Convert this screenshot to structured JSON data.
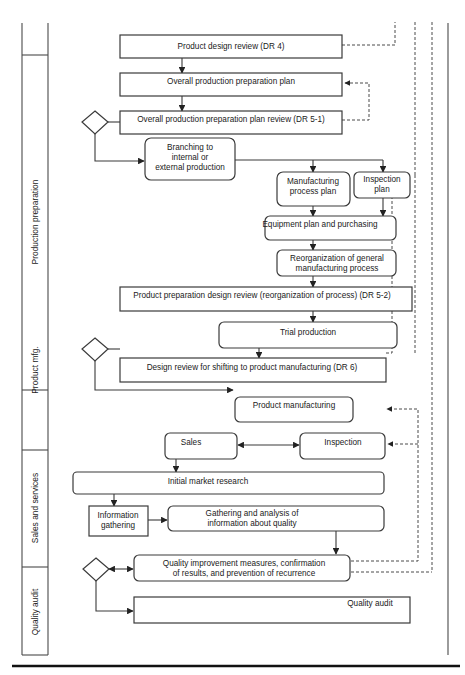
{
  "diagram": {
    "type": "swimlane-flowchart",
    "lanes": [
      {
        "id": "production-preparation",
        "label": "Production preparation"
      },
      {
        "id": "product-mfg",
        "label": "Product mfg."
      },
      {
        "id": "sales-and-services",
        "label": "Sales and services"
      },
      {
        "id": "quality-audit",
        "label": "Quality audit"
      }
    ],
    "nodes": {
      "dr4": {
        "lines": [
          "Product design review  (DR 4)"
        ]
      },
      "overall_plan": {
        "lines": [
          "Overall production preparation plan"
        ]
      },
      "dr5_1": {
        "lines": [
          "Overall production preparation plan review (DR 5-1)"
        ]
      },
      "branching": {
        "lines": [
          "Branching to",
          "internal or",
          "external production"
        ]
      },
      "mfg_process_plan": {
        "lines": [
          "Manufacturing",
          "process plan"
        ]
      },
      "inspection_plan": {
        "lines": [
          "Inspection",
          "plan"
        ]
      },
      "equipment": {
        "lines": [
          "Equipment plan and purchasing"
        ]
      },
      "reorganization": {
        "lines": [
          "Reorganization of general",
          "manufacturing process"
        ]
      },
      "dr5_2": {
        "lines": [
          "Product preparation design review  (reorganization of process) (DR 5-2)"
        ]
      },
      "trial": {
        "lines": [
          "Trial production"
        ]
      },
      "dr6": {
        "lines": [
          "Design review  for shifting to product manufacturing (DR 6)"
        ]
      },
      "product_mfg": {
        "lines": [
          "Product manufacturing"
        ]
      },
      "sales": {
        "lines": [
          "Sales"
        ]
      },
      "inspection": {
        "lines": [
          "Inspection"
        ]
      },
      "market_research": {
        "lines": [
          "Initial market research"
        ]
      },
      "info_gathering": {
        "lines": [
          "Information",
          "gathering"
        ]
      },
      "gathering_analysis": {
        "lines": [
          "Gathering and analysis of",
          "information about quality"
        ]
      },
      "quality_improvement": {
        "lines": [
          "Quality improvement measures, confirmation",
          "of results, and prevention of recurrence"
        ]
      },
      "quality_audit": {
        "lines": [
          "Quality audit"
        ]
      }
    },
    "decisions": [
      {
        "id": "decision-dr5-1"
      },
      {
        "id": "decision-dr6"
      },
      {
        "id": "decision-quality"
      }
    ],
    "colors": {
      "stroke": "#3a3a3a",
      "background": "#ffffff",
      "text": "#1a1a1a"
    }
  }
}
